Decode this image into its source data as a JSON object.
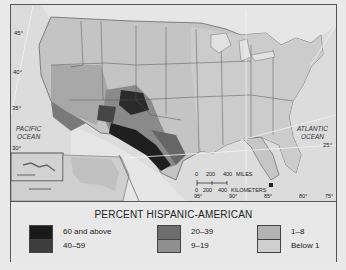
{
  "map": {
    "ocean_labels": {
      "pacific_line1": "PACIFIC",
      "pacific_line2": "OCEAN",
      "atlantic_line1": "ATLANTIC",
      "atlantic_line2": "OCEAN"
    },
    "latitude_labels": [
      "45°",
      "40°",
      "35°",
      "30°",
      "25°"
    ],
    "longitude_labels": [
      "95°",
      "90°",
      "85°",
      "80°",
      "75°"
    ],
    "scale_bar": {
      "miles_label": "MILES",
      "miles_ticks": [
        "0",
        "200",
        "400"
      ],
      "km_label": "KILOMETERS",
      "km_ticks": [
        "0",
        "200",
        "400"
      ]
    },
    "insets": [
      "Hawaii",
      "Alaska"
    ]
  },
  "legend": {
    "title": "PERCENT HISPANIC-AMERICAN",
    "classes": [
      {
        "label": "60 and above",
        "color": "#1a1a1a"
      },
      {
        "label": "40–59",
        "color": "#3d3d3d"
      },
      {
        "label": "20–39",
        "color": "#6e6e6e"
      },
      {
        "label": "9–19",
        "color": "#8f8f8f"
      },
      {
        "label": "1–8",
        "color": "#b3b3b3"
      },
      {
        "label": "Below 1",
        "color": "#cfcfcf"
      }
    ]
  }
}
